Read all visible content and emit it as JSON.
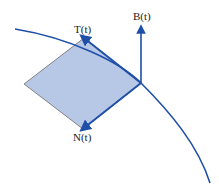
{
  "diagram": {
    "labels": {
      "tangent": "T(t)",
      "normal": "N(t)",
      "binormal": "B(t)"
    },
    "colors": {
      "curve": "#1f4fa8",
      "plane_fill": "#b7c8e6",
      "plane_edge": "#6b6b6b",
      "text": "#222222"
    }
  }
}
